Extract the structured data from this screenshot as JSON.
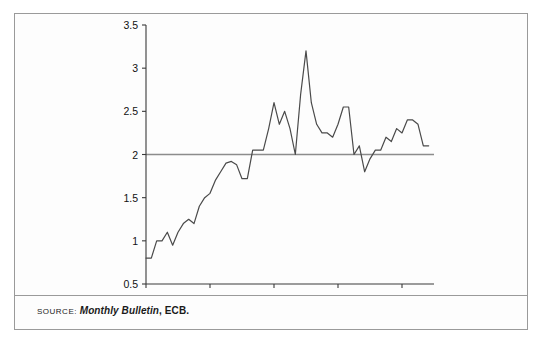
{
  "figure": {
    "source_label": "SOURCE:",
    "source_publication": "Monthly Bulletin",
    "source_rest": ", ECB."
  },
  "chart_data": {
    "type": "line",
    "title": "",
    "subtitle": "",
    "xlabel": "",
    "ylabel": "",
    "grid": false,
    "legend": false,
    "legend_position": "none",
    "ylim": [
      0.5,
      3.5
    ],
    "ytick_labels": [
      "0.5",
      "1",
      "1.5",
      "2",
      "2.5",
      "3",
      "3.5"
    ],
    "yticks": [
      0.5,
      1,
      1.5,
      2,
      2.5,
      3,
      3.5
    ],
    "xtick_labels": [
      "Jan. 99",
      "Jan. 00",
      "Jan. 01",
      "Jan. 02",
      "Jan. 03"
    ],
    "xticks": [
      0,
      12,
      24,
      36,
      48
    ],
    "xlim": [
      0,
      54
    ],
    "reference_line": {
      "value": 2,
      "color": "#8c8c8c",
      "orientation": "horizontal"
    },
    "line_color": "#4a4a4a",
    "series": [
      {
        "name": "HICP inflation",
        "x": [
          0,
          1,
          2,
          3,
          4,
          5,
          6,
          7,
          8,
          9,
          10,
          11,
          12,
          13,
          14,
          15,
          16,
          17,
          18,
          19,
          20,
          21,
          22,
          23,
          24,
          25,
          26,
          27,
          28,
          29,
          30,
          31,
          32,
          33,
          34,
          35,
          36,
          37,
          38,
          39,
          40,
          41,
          42,
          43,
          44,
          45,
          46,
          47,
          48,
          49,
          50,
          51,
          52,
          53
        ],
        "values": [
          0.8,
          0.8,
          1.0,
          1.0,
          1.1,
          0.95,
          1.1,
          1.2,
          1.25,
          1.2,
          1.4,
          1.5,
          1.55,
          1.7,
          1.8,
          1.9,
          1.92,
          1.88,
          1.72,
          1.72,
          2.05,
          2.05,
          2.05,
          2.3,
          2.6,
          2.35,
          2.5,
          2.3,
          2.0,
          2.7,
          3.2,
          2.6,
          2.35,
          2.25,
          2.25,
          2.2,
          2.35,
          2.55,
          2.55,
          2.0,
          2.1,
          1.8,
          1.95,
          2.05,
          2.05,
          2.2,
          2.15,
          2.3,
          2.25,
          2.4,
          2.4,
          2.35,
          2.1,
          2.1
        ]
      }
    ]
  }
}
